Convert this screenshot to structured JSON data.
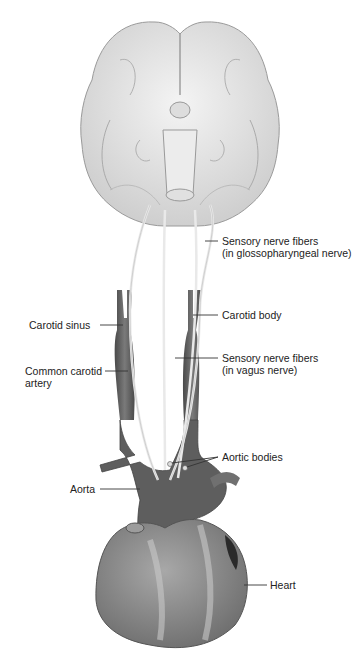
{
  "figure": {
    "colors": {
      "vessel": "#5d5d5d",
      "brain": "#e4e4e4",
      "heart": "#8a8a8a",
      "nerve": "#efefef",
      "leader": "#333333",
      "text": "#222222"
    }
  },
  "labels": {
    "glosso_line1": "Sensory nerve fibers",
    "glosso_line2": "(in glossopharyngeal nerve)",
    "carotid_sinus": "Carotid sinus",
    "carotid_body": "Carotid body",
    "common_carotid_line1": "Common carotid",
    "common_carotid_line2": "artery",
    "vagus_line1": "Sensory nerve fibers",
    "vagus_line2": "(in vagus nerve)",
    "aortic_bodies": "Aortic bodies",
    "aorta": "Aorta",
    "heart": "Heart"
  }
}
